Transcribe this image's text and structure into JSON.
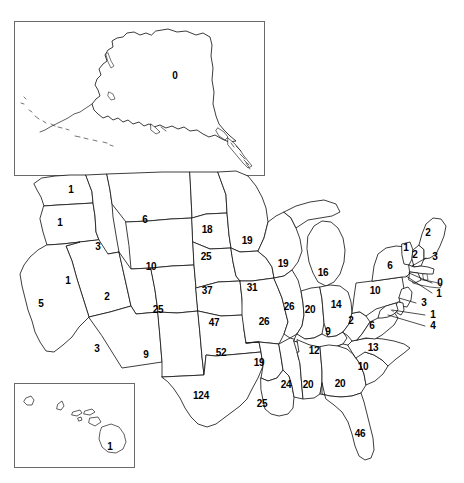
{
  "figure": {
    "type": "choropleth-outline-map",
    "region": "United States",
    "label_style": "numeric value printed inside each state outline",
    "insets": [
      {
        "name": "alaska-inset",
        "state": "Alaska",
        "value": "0"
      },
      {
        "name": "hawaii-inset",
        "state": "Hawaii",
        "value": "1"
      }
    ]
  },
  "chart_data": {
    "type": "map",
    "title": "",
    "value_label": "",
    "states": [
      {
        "code": "AK",
        "name": "Alaska",
        "value": 0,
        "label": "0",
        "x": 175,
        "y": 76,
        "inset": true
      },
      {
        "code": "HI",
        "name": "Hawaii",
        "value": 1,
        "label": "1",
        "x": 110,
        "y": 447,
        "inset": true
      },
      {
        "code": "WA",
        "name": "Washington",
        "value": 1,
        "label": "1",
        "x": 71,
        "y": 190
      },
      {
        "code": "OR",
        "name": "Oregon",
        "value": 1,
        "label": "1",
        "x": 60,
        "y": 223
      },
      {
        "code": "ID",
        "name": "Idaho",
        "value": 3,
        "label": "3",
        "x": 98,
        "y": 247
      },
      {
        "code": "MT",
        "name": "Montana",
        "value": 6,
        "label": "6",
        "x": 145,
        "y": 220
      },
      {
        "code": "WY",
        "name": "Wyoming",
        "value": 10,
        "label": "10",
        "x": 151,
        "y": 267
      },
      {
        "code": "CA",
        "name": "California",
        "value": 5,
        "label": "5",
        "x": 41,
        "y": 304
      },
      {
        "code": "NV",
        "name": "Nevada",
        "value": 1,
        "label": "1",
        "x": 68,
        "y": 281
      },
      {
        "code": "UT",
        "name": "Utah",
        "value": 2,
        "label": "2",
        "x": 107,
        "y": 297
      },
      {
        "code": "AZ",
        "name": "Arizona",
        "value": 3,
        "label": "3",
        "x": 97,
        "y": 349
      },
      {
        "code": "NM",
        "name": "New Mexico",
        "value": 9,
        "label": "9",
        "x": 146,
        "y": 355
      },
      {
        "code": "CO",
        "name": "Colorado",
        "value": 25,
        "label": "25",
        "x": 158,
        "y": 310
      },
      {
        "code": "ND",
        "name": "North Dakota",
        "value": 18,
        "label": "18",
        "x": 207,
        "y": 230
      },
      {
        "code": "SD",
        "name": "South Dakota",
        "value": 25,
        "label": "25",
        "x": 206,
        "y": 257
      },
      {
        "code": "NE",
        "name": "Nebraska",
        "value": 37,
        "label": "37",
        "x": 207,
        "y": 291
      },
      {
        "code": "KS",
        "name": "Kansas",
        "value": 47,
        "label": "47",
        "x": 214,
        "y": 323
      },
      {
        "code": "OK",
        "name": "Oklahoma",
        "value": 52,
        "label": "52",
        "x": 221,
        "y": 353
      },
      {
        "code": "TX",
        "name": "Texas",
        "value": 124,
        "label": "124",
        "x": 201,
        "y": 396
      },
      {
        "code": "MN",
        "name": "Minnesota",
        "value": 19,
        "label": "19",
        "x": 247,
        "y": 241
      },
      {
        "code": "IA",
        "name": "Iowa",
        "value": 31,
        "label": "31",
        "x": 252,
        "y": 288
      },
      {
        "code": "MO",
        "name": "Missouri",
        "value": 26,
        "label": "26",
        "x": 264,
        "y": 322
      },
      {
        "code": "AR",
        "name": "Arkansas",
        "value": 19,
        "label": "19",
        "x": 259,
        "y": 363
      },
      {
        "code": "LA",
        "name": "Louisiana",
        "value": 25,
        "label": "25",
        "x": 262,
        "y": 404
      },
      {
        "code": "WI",
        "name": "Wisconsin",
        "value": 19,
        "label": "19",
        "x": 283,
        "y": 264
      },
      {
        "code": "IL",
        "name": "Illinois",
        "value": 26,
        "label": "26",
        "x": 289,
        "y": 307
      },
      {
        "code": "MS",
        "name": "Mississippi",
        "value": 24,
        "label": "24",
        "x": 286,
        "y": 385
      },
      {
        "code": "MI",
        "name": "Michigan",
        "value": 16,
        "label": "16",
        "x": 323,
        "y": 273
      },
      {
        "code": "IN",
        "name": "Indiana",
        "value": 20,
        "label": "20",
        "x": 310,
        "y": 310
      },
      {
        "code": "KY",
        "name": "Kentucky",
        "value": 9,
        "label": "9",
        "x": 328,
        "y": 332
      },
      {
        "code": "TN",
        "name": "Tennessee",
        "value": 12,
        "label": "12",
        "x": 314,
        "y": 351
      },
      {
        "code": "AL",
        "name": "Alabama",
        "value": 20,
        "label": "20",
        "x": 308,
        "y": 385
      },
      {
        "code": "OH",
        "name": "Ohio",
        "value": 14,
        "label": "14",
        "x": 336,
        "y": 305
      },
      {
        "code": "GA",
        "name": "Georgia",
        "value": 20,
        "label": "20",
        "x": 340,
        "y": 384
      },
      {
        "code": "FL",
        "name": "Florida",
        "value": 46,
        "label": "46",
        "x": 360,
        "y": 434
      },
      {
        "code": "SC",
        "name": "South Carolina",
        "value": 10,
        "label": "10",
        "x": 363,
        "y": 367
      },
      {
        "code": "NC",
        "name": "North Carolina",
        "value": 13,
        "label": "13",
        "x": 373,
        "y": 348
      },
      {
        "code": "VA",
        "name": "Virginia",
        "value": 6,
        "label": "6",
        "x": 372,
        "y": 326
      },
      {
        "code": "WV",
        "name": "West Virginia",
        "value": 2,
        "label": "2",
        "x": 351,
        "y": 321
      },
      {
        "code": "PA",
        "name": "Pennsylvania",
        "value": 10,
        "label": "10",
        "x": 375,
        "y": 291
      },
      {
        "code": "NY",
        "name": "New York",
        "value": 6,
        "label": "6",
        "x": 390,
        "y": 266
      },
      {
        "code": "VT",
        "name": "Vermont",
        "value": 1,
        "label": "1",
        "x": 406,
        "y": 248
      },
      {
        "code": "NH",
        "name": "New Hampshire",
        "value": 2,
        "label": "2",
        "x": 415,
        "y": 255
      },
      {
        "code": "ME",
        "name": "Maine",
        "value": 2,
        "label": "2",
        "x": 428,
        "y": 233
      },
      {
        "code": "MA",
        "name": "Massachusetts",
        "value": 3,
        "label": "3",
        "x": 435,
        "y": 257
      },
      {
        "code": "RI",
        "name": "Rhode Island",
        "value": 0,
        "label": "0",
        "x": 440,
        "y": 283
      },
      {
        "code": "CT",
        "name": "Connecticut",
        "value": 1,
        "label": "1",
        "x": 439,
        "y": 294
      },
      {
        "code": "NJ",
        "name": "New Jersey",
        "value": 3,
        "label": "3",
        "x": 424,
        "y": 303
      },
      {
        "code": "DE",
        "name": "Delaware",
        "value": 1,
        "label": "1",
        "x": 433,
        "y": 315
      },
      {
        "code": "MD",
        "name": "Maryland",
        "value": 4,
        "label": "4",
        "x": 433,
        "y": 326
      }
    ],
    "leader_lines": [
      {
        "state": "MA",
        "x1": 426,
        "y1": 258,
        "x2": 412,
        "y2": 266
      },
      {
        "state": "RI",
        "x1": 432,
        "y1": 283,
        "x2": 409,
        "y2": 273
      },
      {
        "state": "CT",
        "x1": 432,
        "y1": 293,
        "x2": 406,
        "y2": 276
      },
      {
        "state": "NJ",
        "x1": 416,
        "y1": 303,
        "x2": 399,
        "y2": 298
      },
      {
        "state": "DE",
        "x1": 425,
        "y1": 315,
        "x2": 392,
        "y2": 310
      },
      {
        "state": "MD",
        "x1": 425,
        "y1": 326,
        "x2": 388,
        "y2": 315
      }
    ],
    "total_states": 51,
    "value_range": [
      0,
      124
    ],
    "min_state": "Alaska / Rhode Island",
    "max_state": "Texas"
  }
}
